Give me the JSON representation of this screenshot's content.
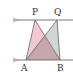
{
  "diagram": {
    "type": "geometry",
    "points": {
      "P": {
        "label": "P",
        "x": 35,
        "y": 20
      },
      "Q": {
        "label": "Q",
        "x": 57,
        "y": 20
      },
      "A": {
        "label": "A",
        "x": 26,
        "y": 60
      },
      "B": {
        "label": "B",
        "x": 60,
        "y": 60
      }
    },
    "lines": [
      {
        "name": "upper-parallel",
        "x1": 13,
        "y1": 20,
        "x2": 73,
        "y2": 20
      },
      {
        "name": "lower-parallel",
        "x1": 13,
        "y1": 60,
        "x2": 73,
        "y2": 60
      }
    ],
    "triangles": [
      {
        "name": "PAB",
        "vertices": [
          "P",
          "A",
          "B"
        ],
        "fill": "#f2c9d2"
      },
      {
        "name": "QAB",
        "vertices": [
          "Q",
          "A",
          "B"
        ],
        "fill": "#c9cfcc"
      }
    ],
    "overlap_fill": "#c7a7ad",
    "colors": {
      "line": "#555555",
      "arrow": "#d98a99",
      "label": "#333333"
    }
  }
}
